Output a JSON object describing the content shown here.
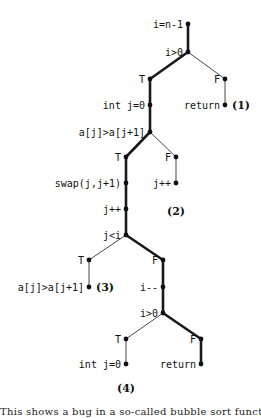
{
  "diagram": {
    "type": "execution-tree",
    "nodes": [
      {
        "id": "n1",
        "label": "i=n-1",
        "x": 188,
        "y": 24,
        "label_side": "left"
      },
      {
        "id": "n2",
        "label": "i>0",
        "x": 188,
        "y": 52,
        "label_side": "left"
      },
      {
        "id": "n3",
        "label": "T",
        "x": 150,
        "y": 79,
        "label_side": "left",
        "kind": "branch"
      },
      {
        "id": "n4",
        "label": "F",
        "x": 225,
        "y": 79,
        "label_side": "left",
        "kind": "branch"
      },
      {
        "id": "n5",
        "label": "int j=0",
        "x": 150,
        "y": 105,
        "label_side": "left"
      },
      {
        "id": "n6",
        "label": "return",
        "x": 225,
        "y": 105,
        "label_side": "left"
      },
      {
        "id": "n7",
        "label": "a[j]>a[j+1]",
        "x": 150,
        "y": 132,
        "label_side": "left"
      },
      {
        "id": "n8",
        "label": "T",
        "x": 126,
        "y": 157,
        "label_side": "left",
        "kind": "branch"
      },
      {
        "id": "n9",
        "label": "F",
        "x": 176,
        "y": 157,
        "label_side": "left",
        "kind": "branch"
      },
      {
        "id": "n10",
        "label": "swap(j,j+1)",
        "x": 126,
        "y": 183,
        "label_side": "left"
      },
      {
        "id": "n11",
        "label": "j++",
        "x": 176,
        "y": 183,
        "label_side": "left"
      },
      {
        "id": "n12",
        "label": "j++",
        "x": 126,
        "y": 209,
        "label_side": "left"
      },
      {
        "id": "n13",
        "label": "j<i",
        "x": 126,
        "y": 235,
        "label_side": "left"
      },
      {
        "id": "n14",
        "label": "T",
        "x": 89,
        "y": 260,
        "label_side": "left",
        "kind": "branch"
      },
      {
        "id": "n15",
        "label": "F",
        "x": 163,
        "y": 260,
        "label_side": "left",
        "kind": "branch"
      },
      {
        "id": "n16",
        "label": "a[j]>a[j+1]",
        "x": 89,
        "y": 287,
        "label_side": "left"
      },
      {
        "id": "n17",
        "label": "i--",
        "x": 163,
        "y": 287,
        "label_side": "left"
      },
      {
        "id": "n18",
        "label": "i>0",
        "x": 163,
        "y": 313,
        "label_side": "left"
      },
      {
        "id": "n19",
        "label": "T",
        "x": 126,
        "y": 339,
        "label_side": "left",
        "kind": "branch"
      },
      {
        "id": "n20",
        "label": "F",
        "x": 201,
        "y": 339,
        "label_side": "left",
        "kind": "branch"
      },
      {
        "id": "n21",
        "label": "int j=0",
        "x": 126,
        "y": 364,
        "label_side": "left"
      },
      {
        "id": "n22",
        "label": "return",
        "x": 201,
        "y": 364,
        "label_side": "left"
      }
    ],
    "edges": [
      {
        "from": "n1",
        "to": "n2",
        "style": "thick"
      },
      {
        "from": "n2",
        "to": "n3",
        "style": "thick"
      },
      {
        "from": "n2",
        "to": "n4",
        "style": "thin"
      },
      {
        "from": "n3",
        "to": "n5",
        "style": "thick"
      },
      {
        "from": "n4",
        "to": "n6",
        "style": "thin"
      },
      {
        "from": "n5",
        "to": "n7",
        "style": "thick"
      },
      {
        "from": "n7",
        "to": "n8",
        "style": "thick"
      },
      {
        "from": "n7",
        "to": "n9",
        "style": "thin"
      },
      {
        "from": "n8",
        "to": "n10",
        "style": "thick"
      },
      {
        "from": "n9",
        "to": "n11",
        "style": "thin"
      },
      {
        "from": "n10",
        "to": "n12",
        "style": "thick"
      },
      {
        "from": "n12",
        "to": "n13",
        "style": "thick"
      },
      {
        "from": "n13",
        "to": "n14",
        "style": "thin"
      },
      {
        "from": "n13",
        "to": "n15",
        "style": "thick"
      },
      {
        "from": "n14",
        "to": "n16",
        "style": "thin"
      },
      {
        "from": "n15",
        "to": "n17",
        "style": "thick"
      },
      {
        "from": "n17",
        "to": "n18",
        "style": "thick"
      },
      {
        "from": "n18",
        "to": "n19",
        "style": "thin"
      },
      {
        "from": "n18",
        "to": "n20",
        "style": "thick"
      },
      {
        "from": "n19",
        "to": "n21",
        "style": "thin"
      },
      {
        "from": "n20",
        "to": "n22",
        "style": "thick"
      }
    ],
    "case_labels": [
      {
        "label": "(1)",
        "x": 232,
        "y": 109,
        "anchor": "start"
      },
      {
        "label": "(2)",
        "x": 176,
        "y": 215,
        "anchor": "middle"
      },
      {
        "label": "(3)",
        "x": 96,
        "y": 291,
        "anchor": "start"
      },
      {
        "label": "(4)",
        "x": 126,
        "y": 392,
        "anchor": "middle"
      }
    ]
  },
  "caption": {
    "text": "This shows a bug in a so-called bubble sort function as reported"
  }
}
